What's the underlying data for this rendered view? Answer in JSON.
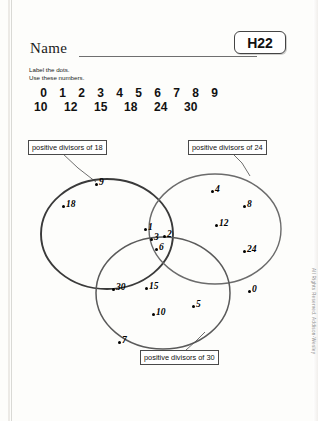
{
  "worksheet": {
    "name_label": "Name",
    "code": "H22",
    "instructions_line1": "Label the dots.",
    "instructions_line2": "Use these numbers.",
    "numbers_row1": [
      "0",
      "1",
      "2",
      "3",
      "4",
      "5",
      "6",
      "7",
      "8",
      "9"
    ],
    "numbers_row2": [
      "10",
      "12",
      "15",
      "18",
      "24",
      "30"
    ],
    "copyright": "All Rights Reserved.  Addison-Wesley"
  },
  "venn": {
    "callouts": {
      "left": "positive divisors of 18",
      "right": "positive divisors of 24",
      "bottom": "positive divisors of 30"
    },
    "points": [
      {
        "label": "9",
        "region": "left-only",
        "x": 95,
        "y": 183
      },
      {
        "label": "18",
        "region": "left-only",
        "x": 62,
        "y": 205
      },
      {
        "label": "4",
        "region": "right-only",
        "x": 211,
        "y": 190
      },
      {
        "label": "8",
        "region": "right-only",
        "x": 243,
        "y": 205
      },
      {
        "label": "12",
        "region": "right-only",
        "x": 215,
        "y": 224
      },
      {
        "label": "24",
        "region": "right-only",
        "x": 243,
        "y": 250
      },
      {
        "label": "1",
        "region": "triple-overlap",
        "x": 144,
        "y": 228
      },
      {
        "label": "3",
        "region": "triple-overlap",
        "x": 150,
        "y": 238
      },
      {
        "label": "2",
        "region": "triple-overlap",
        "x": 163,
        "y": 235
      },
      {
        "label": "6",
        "region": "triple-overlap",
        "x": 155,
        "y": 248
      },
      {
        "label": "30",
        "region": "bottom-only",
        "x": 112,
        "y": 288
      },
      {
        "label": "15",
        "region": "bottom-only",
        "x": 145,
        "y": 287
      },
      {
        "label": "10",
        "region": "bottom-only",
        "x": 152,
        "y": 313
      },
      {
        "label": "5",
        "region": "bottom-only",
        "x": 192,
        "y": 305
      },
      {
        "label": "7",
        "region": "outside",
        "x": 118,
        "y": 341
      },
      {
        "label": "0",
        "region": "outside",
        "x": 248,
        "y": 290
      }
    ],
    "circles": [
      {
        "name": "left",
        "cx": 107,
        "cy": 234,
        "rx": 66,
        "ry": 55,
        "stroke": "#3a3a3a",
        "width": 1.9
      },
      {
        "name": "right",
        "cx": 215,
        "cy": 229,
        "rx": 66,
        "ry": 55,
        "stroke": "#6b6b6b",
        "width": 1.4
      },
      {
        "name": "bottom",
        "cx": 163,
        "cy": 293,
        "rx": 67,
        "ry": 56,
        "stroke": "#5a5a5a",
        "width": 1.5
      }
    ]
  }
}
